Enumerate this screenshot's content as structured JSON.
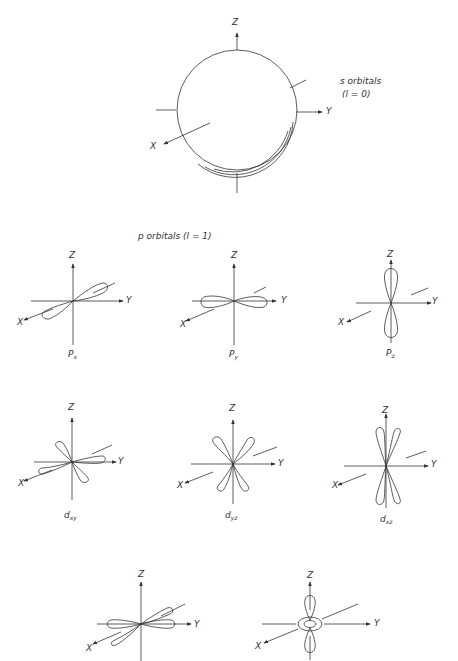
{
  "s_section": {
    "title_line1": "s orbitals",
    "title_line2": "(l = 0)",
    "axes": {
      "z": "Z",
      "y": "Y",
      "x": "X"
    }
  },
  "p_section": {
    "title": "p orbitals  (l = 1)",
    "orbitals": [
      {
        "name": "P",
        "sub": "x",
        "axes": {
          "z": "Z",
          "y": "Y",
          "x": "X"
        }
      },
      {
        "name": "P",
        "sub": "y",
        "axes": {
          "z": "Z",
          "y": "Y",
          "x": "X"
        }
      },
      {
        "name": "P",
        "sub": "z",
        "axes": {
          "z": "Z",
          "y": "Y",
          "x": "X"
        }
      }
    ]
  },
  "d_section": {
    "orbitals": [
      {
        "name": "d",
        "sub": "xy",
        "axes": {
          "z": "Z",
          "y": "Y",
          "x": "X"
        }
      },
      {
        "name": "d",
        "sub": "yz",
        "axes": {
          "z": "Z",
          "y": "Y",
          "x": "X"
        }
      },
      {
        "name": "d",
        "sub": "xz",
        "axes": {
          "z": "Z",
          "y": "Y",
          "x": "X"
        }
      },
      {
        "name": "",
        "sub": "",
        "axes": {
          "z": "Z",
          "y": "Y",
          "x": "X"
        }
      },
      {
        "name": "",
        "sub": "",
        "axes": {
          "z": "Z",
          "y": "Y",
          "x": "X"
        }
      }
    ]
  },
  "colors": {
    "line": "#333333",
    "background": "#ffffff"
  }
}
